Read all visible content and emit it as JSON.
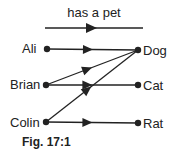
{
  "relation_label": "has a pet",
  "domain_set": [
    {
      "id": "ali",
      "label": "Ali"
    },
    {
      "id": "brian",
      "label": "Brian"
    },
    {
      "id": "colin",
      "label": "Colin"
    }
  ],
  "codomain_set": [
    {
      "id": "dog",
      "label": "Dog"
    },
    {
      "id": "cat",
      "label": "Cat"
    },
    {
      "id": "rat",
      "label": "Rat"
    }
  ],
  "mappings": [
    {
      "from": "ali",
      "to": "dog"
    },
    {
      "from": "brian",
      "to": "dog"
    },
    {
      "from": "brian",
      "to": "cat"
    },
    {
      "from": "colin",
      "to": "dog"
    },
    {
      "from": "colin",
      "to": "rat"
    }
  ],
  "caption": "Fig. 17:1",
  "colors": {
    "ink": "#222222",
    "background": "#ffffff"
  }
}
